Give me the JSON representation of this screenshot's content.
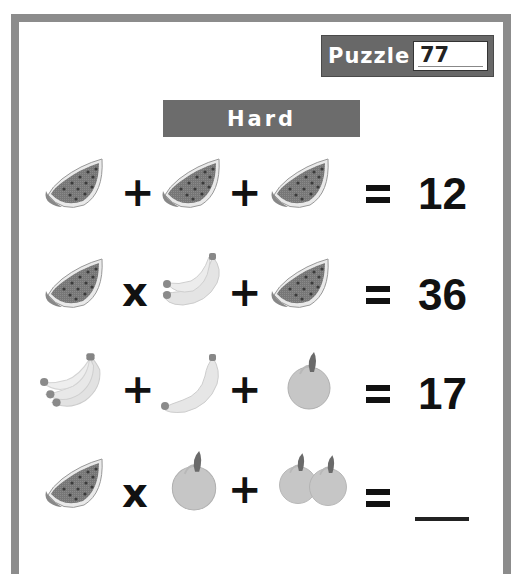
{
  "puzzle": {
    "label": "Puzzle",
    "number": "77"
  },
  "difficulty": "Hard",
  "colors": {
    "frame": "#8c8c8c",
    "badge_bg": "#686868",
    "difficulty_bg": "#6c6c6c",
    "watermelon": "#7a7a7a",
    "banana": "#e0e0e0",
    "pear": "#c4c4c4",
    "text": "#111111"
  },
  "equations": [
    {
      "terms": [
        {
          "icon": "watermelon-icon",
          "count": 1
        },
        {
          "op": "+"
        },
        {
          "icon": "watermelon-icon",
          "count": 1
        },
        {
          "op": "+"
        },
        {
          "icon": "watermelon-icon",
          "count": 1
        }
      ],
      "equals": "=",
      "result": "12"
    },
    {
      "terms": [
        {
          "icon": "watermelon-icon",
          "count": 1
        },
        {
          "op": "x"
        },
        {
          "icon": "banana-icon",
          "count": 2
        },
        {
          "op": "+"
        },
        {
          "icon": "watermelon-icon",
          "count": 1
        }
      ],
      "equals": "=",
      "result": "36"
    },
    {
      "terms": [
        {
          "icon": "banana-icon",
          "count": 3
        },
        {
          "op": "+"
        },
        {
          "icon": "banana-icon",
          "count": 2
        },
        {
          "op": "+"
        },
        {
          "icon": "pear-icon",
          "count": 1
        }
      ],
      "equals": "=",
      "result": "17"
    },
    {
      "terms": [
        {
          "icon": "watermelon-icon",
          "count": 1
        },
        {
          "op": "x"
        },
        {
          "icon": "pear-icon",
          "count": 1
        },
        {
          "op": "+"
        },
        {
          "icon": "pear-icon",
          "count": 2
        }
      ],
      "equals": "=",
      "result": ""
    }
  ],
  "ops": {
    "r1o1": "+",
    "r1o2": "+",
    "r2o1": "x",
    "r2o2": "+",
    "r3o1": "+",
    "r3o2": "+",
    "r4o1": "x",
    "r4o2": "+"
  }
}
